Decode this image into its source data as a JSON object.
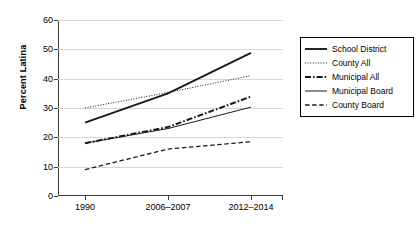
{
  "chart_data": {
    "type": "line",
    "title": "",
    "xlabel": "",
    "ylabel": "Percent Latina",
    "categories": [
      "1990",
      "2006-2007",
      "2012-2014"
    ],
    "ylim": [
      0,
      60
    ],
    "ytick_step": 10,
    "yticks": [
      "0",
      "10",
      "20",
      "30",
      "40",
      "50",
      "60"
    ],
    "grid": true,
    "legend_position": "right",
    "series": [
      {
        "name": "School District",
        "values": [
          25.0,
          35.0,
          48.8
        ],
        "style": "solid-thick"
      },
      {
        "name": "County All",
        "values": [
          30.0,
          35.3,
          41.0
        ],
        "style": "dotted"
      },
      {
        "name": "Municipal All",
        "values": [
          18.0,
          23.5,
          33.9
        ],
        "style": "dash-dot-thick"
      },
      {
        "name": "Municipal Board",
        "values": [
          18.0,
          23.0,
          30.3
        ],
        "style": "solid-thin"
      },
      {
        "name": "County Board",
        "values": [
          9.0,
          16.0,
          18.5
        ],
        "style": "dashed"
      }
    ]
  },
  "legend": {
    "items": [
      {
        "label": "School District"
      },
      {
        "label": "County All"
      },
      {
        "label": "Municipal All"
      },
      {
        "label": "Municipal Board"
      },
      {
        "label": "County Board"
      }
    ]
  },
  "colors": {
    "line": "#1a1a1a",
    "grid": "#d6d6d6",
    "axis": "#3f3f3f"
  },
  "caption": ""
}
